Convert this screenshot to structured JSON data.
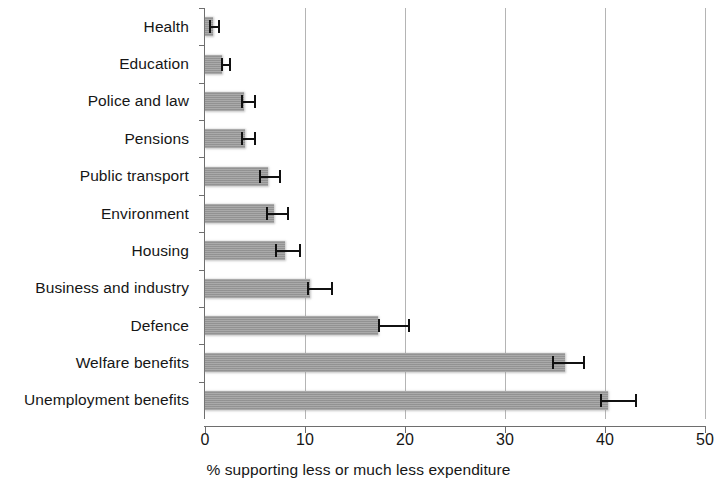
{
  "chart_data": {
    "type": "bar",
    "orientation": "horizontal",
    "title": "",
    "xlabel": "% supporting less or much less expenditure",
    "ylabel": "",
    "xlim": [
      0,
      50
    ],
    "xticks": [
      0,
      10,
      20,
      30,
      40,
      50
    ],
    "xtick_labels": [
      "0",
      "10",
      "20",
      "30",
      "40",
      "50"
    ],
    "grid": "vertical gridlines at 10, 20, 30, 40, 50",
    "legend": "none",
    "bar_color": "#9a9a9a",
    "error_bar_color": "#111111",
    "categories": [
      "Health",
      "Education",
      "Police and law",
      "Pensions",
      "Public transport",
      "Environment",
      "Housing",
      "Business and industry",
      "Defence",
      "Welfare  benefits",
      "Unemployment benefits"
    ],
    "values": [
      0.8,
      1.7,
      3.9,
      4.0,
      6.3,
      6.9,
      8.0,
      10.5,
      17.3,
      36.0,
      40.3
    ],
    "error_low": [
      0.4,
      1.6,
      3.6,
      3.6,
      5.4,
      6.1,
      7.0,
      10.2,
      17.3,
      34.7,
      39.5
    ],
    "error_high": [
      1.5,
      2.6,
      5.1,
      5.1,
      7.6,
      8.4,
      9.6,
      12.8,
      20.5,
      38.0,
      43.2
    ],
    "series": [
      {
        "name": "% supporting less or much less expenditure",
        "values": [
          0.8,
          1.7,
          3.9,
          4.0,
          6.3,
          6.9,
          8.0,
          10.5,
          17.3,
          36.0,
          40.3
        ]
      }
    ]
  }
}
